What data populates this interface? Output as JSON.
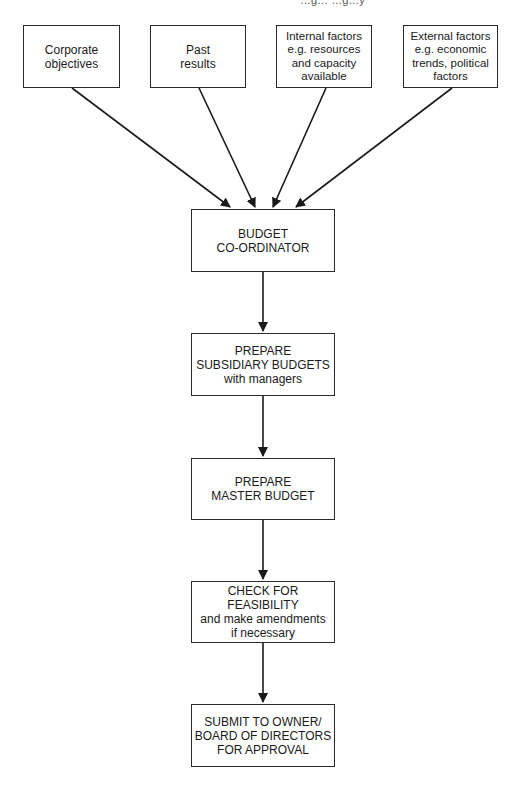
{
  "header_clipped_text": "…g… …g…y",
  "inputs": [
    {
      "id": "corporate",
      "lines": [
        "Corporate",
        "objectives"
      ]
    },
    {
      "id": "past",
      "lines": [
        "Past",
        "results"
      ]
    },
    {
      "id": "internal",
      "lines": [
        "Internal factors",
        "e.g.  resources",
        "and capacity",
        "available"
      ]
    },
    {
      "id": "external",
      "lines": [
        "External factors",
        "e.g.  economic",
        "trends, political",
        "factors"
      ]
    }
  ],
  "steps": [
    {
      "id": "coordinator",
      "lines": [
        "BUDGET",
        "CO-ORDINATOR"
      ]
    },
    {
      "id": "subsidiary",
      "lines": [
        "PREPARE",
        "SUBSIDIARY BUDGETS",
        "with managers"
      ]
    },
    {
      "id": "master",
      "lines": [
        "PREPARE",
        "MASTER BUDGET"
      ]
    },
    {
      "id": "feasibility",
      "lines": [
        "CHECK FOR",
        "FEASIBILITY",
        "and make amendments",
        "if necessary"
      ]
    },
    {
      "id": "submit",
      "lines": [
        "SUBMIT TO OWNER/",
        "BOARD OF DIRECTORS",
        "FOR APPROVAL"
      ]
    }
  ],
  "colors": {
    "line": "#1a1a1a",
    "background": "#ffffff"
  }
}
